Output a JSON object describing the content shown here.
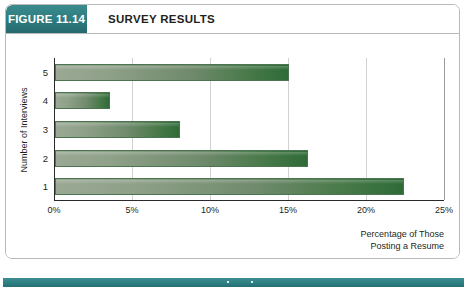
{
  "figure": {
    "badge_label": "FIGURE 11.14",
    "title": "SURVEY RESULTS"
  },
  "colors": {
    "badge_teal": "#2c7c80",
    "bottom_rule_teal": "#2e8183",
    "bar_light": "#9aa894",
    "bar_dark": "#2e6b38",
    "card_border": "#b9b9b9",
    "gridline": "#d2d2d2",
    "axis": "#2a2a2a",
    "text": "#231f20"
  },
  "chart_data": {
    "type": "bar",
    "orientation": "horizontal",
    "title": "SURVEY RESULTS",
    "categories": [
      "1",
      "2",
      "3",
      "4",
      "5"
    ],
    "values": [
      22.4,
      16.2,
      8.0,
      3.5,
      15.0
    ],
    "xlabel": "Percentage of Those Posting a Resume",
    "ylabel": "Number of Interviews",
    "xlim": [
      0,
      25
    ],
    "xticks": [
      0,
      5,
      10,
      15,
      20,
      25
    ],
    "xtick_labels": [
      "0%",
      "5%",
      "10%",
      "15%",
      "20%",
      "25%"
    ],
    "ytick_labels": [
      "5",
      "4",
      "3",
      "2",
      "1"
    ],
    "grid": "vertical",
    "legend": "none",
    "bars": [
      {
        "category": "5",
        "value": 15.0,
        "label": "5"
      },
      {
        "category": "4",
        "value": 3.5,
        "label": "4"
      },
      {
        "category": "3",
        "value": 8.0,
        "label": "3"
      },
      {
        "category": "2",
        "value": 16.2,
        "label": "2"
      },
      {
        "category": "1",
        "value": 22.4,
        "label": "1"
      }
    ]
  },
  "axes": {
    "y_title": "Number of Interviews",
    "x_caption_line1": "Percentage of Those",
    "x_caption_line2": "Posting a Resume"
  }
}
